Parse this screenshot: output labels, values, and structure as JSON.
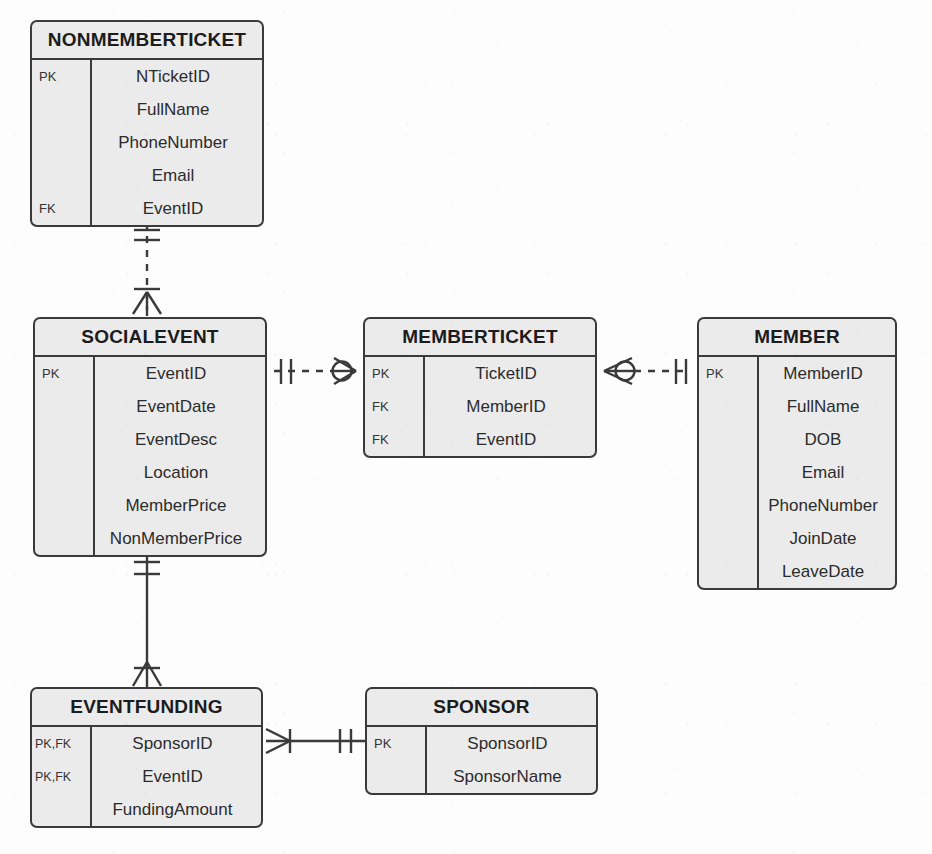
{
  "diagram": {
    "notation": "crow's-foot",
    "colors": {
      "entity_fill": "#ebebeb",
      "entity_border": "#3a3a3a",
      "text": "#2b2b2b",
      "background": "#fdfdfd",
      "line": "#3a3a3a"
    }
  },
  "entities": [
    {
      "id": "nonmemberticket",
      "name": "NONMEMBERTICKET",
      "x": 30,
      "y": 20,
      "width": 234,
      "attributes": [
        {
          "key": "PK",
          "name": "NTicketID"
        },
        {
          "key": "",
          "name": "FullName"
        },
        {
          "key": "",
          "name": "PhoneNumber"
        },
        {
          "key": "",
          "name": "Email"
        },
        {
          "key": "FK",
          "name": "EventID"
        }
      ]
    },
    {
      "id": "socialevent",
      "name": "SOCIALEVENT",
      "x": 33,
      "y": 317,
      "width": 234,
      "attributes": [
        {
          "key": "PK",
          "name": "EventID"
        },
        {
          "key": "",
          "name": "EventDate"
        },
        {
          "key": "",
          "name": "EventDesc"
        },
        {
          "key": "",
          "name": "Location"
        },
        {
          "key": "",
          "name": "MemberPrice"
        },
        {
          "key": "",
          "name": "NonMemberPrice"
        }
      ]
    },
    {
      "id": "memberticket",
      "name": "MEMBERTICKET",
      "x": 363,
      "y": 317,
      "width": 234,
      "attributes": [
        {
          "key": "PK",
          "name": "TicketID"
        },
        {
          "key": "FK",
          "name": "MemberID"
        },
        {
          "key": "FK",
          "name": "EventID"
        }
      ]
    },
    {
      "id": "member",
      "name": "MEMBER",
      "x": 697,
      "y": 317,
      "width": 200,
      "attributes": [
        {
          "key": "PK",
          "name": "MemberID"
        },
        {
          "key": "",
          "name": "FullName"
        },
        {
          "key": "",
          "name": "DOB"
        },
        {
          "key": "",
          "name": "Email"
        },
        {
          "key": "",
          "name": "PhoneNumber"
        },
        {
          "key": "",
          "name": "JoinDate"
        },
        {
          "key": "",
          "name": "LeaveDate"
        }
      ]
    },
    {
      "id": "eventfunding",
      "name": "EVENTFUNDING",
      "x": 30,
      "y": 687,
      "width": 233,
      "attributes": [
        {
          "key": "PK,FK",
          "name": "SponsorID"
        },
        {
          "key": "PK,FK",
          "name": "EventID"
        },
        {
          "key": "",
          "name": "FundingAmount"
        }
      ]
    },
    {
      "id": "sponsor",
      "name": "SPONSOR",
      "x": 365,
      "y": 687,
      "width": 233,
      "attributes": [
        {
          "key": "PK",
          "name": "SponsorID"
        },
        {
          "key": "",
          "name": "SponsorName"
        }
      ]
    }
  ],
  "relationships": [
    {
      "id": "socialevent-nonmemberticket",
      "from": "SOCIALEVENT",
      "to": "NONMEMBERTICKET",
      "style": "dashed",
      "from_cardinality": "zero-or-many",
      "to_cardinality": "one-and-only-one"
    },
    {
      "id": "socialevent-memberticket",
      "from": "SOCIALEVENT",
      "to": "MEMBERTICKET",
      "style": "dashed",
      "from_cardinality": "one-and-only-one",
      "to_cardinality": "zero-or-many"
    },
    {
      "id": "memberticket-member",
      "from": "MEMBERTICKET",
      "to": "MEMBER",
      "style": "dashed",
      "from_cardinality": "zero-or-many",
      "to_cardinality": "one-and-only-one"
    },
    {
      "id": "socialevent-eventfunding",
      "from": "SOCIALEVENT",
      "to": "EVENTFUNDING",
      "style": "solid",
      "from_cardinality": "one-and-only-one",
      "to_cardinality": "one-or-many"
    },
    {
      "id": "eventfunding-sponsor",
      "from": "EVENTFUNDING",
      "to": "SPONSOR",
      "style": "solid",
      "from_cardinality": "one-or-many",
      "to_cardinality": "one-and-only-one"
    }
  ]
}
